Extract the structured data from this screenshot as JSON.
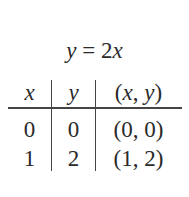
{
  "title": {
    "lhs": "y",
    "eq": " = 2",
    "rhs_var": "x"
  },
  "table": {
    "headers": [
      {
        "var": "x"
      },
      {
        "var": "y"
      },
      {
        "open": "(",
        "v1": "x",
        "sep": ", ",
        "v2": "y",
        "close": ")"
      }
    ],
    "rows": [
      {
        "x": "0",
        "y": "0",
        "pair": "(0, 0)"
      },
      {
        "x": "1",
        "y": "2",
        "pair": "(1, 2)"
      }
    ]
  }
}
